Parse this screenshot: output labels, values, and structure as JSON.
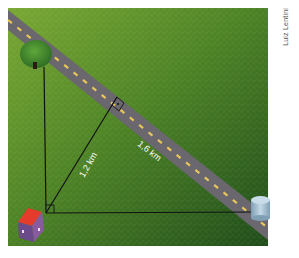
{
  "figure": {
    "credit": "Luiz Lentini",
    "labels": {
      "altitude": "1,2 km",
      "segment": "1,6 km"
    },
    "objects": {
      "tree": "tree",
      "house": "house",
      "tank": "water-tank",
      "road": "road"
    },
    "colors": {
      "grass_light": "#6a9a2c",
      "grass_dark": "#2a5a1c",
      "road": "#6e6a70",
      "road_dash": "#e8c65a",
      "line": "#111111",
      "label": "#ffffff",
      "house_roof": "#e53b2c",
      "house_wall": "#6a4a8a",
      "tank": "#a9c4d6"
    }
  }
}
